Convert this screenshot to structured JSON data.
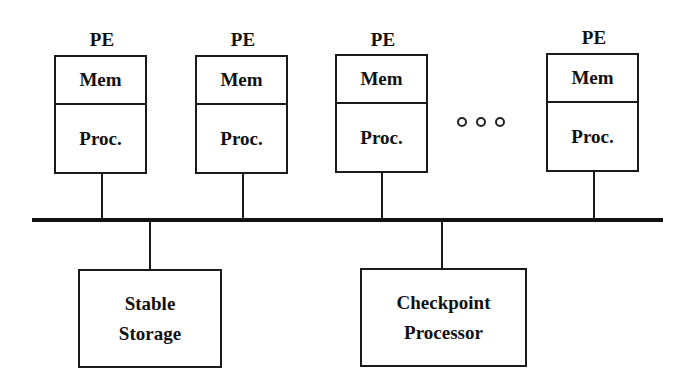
{
  "diagram": {
    "type": "system-architecture",
    "pe_elements": [
      {
        "label": "PE",
        "mem": "Mem",
        "proc": "Proc."
      },
      {
        "label": "PE",
        "mem": "Mem",
        "proc": "Proc."
      },
      {
        "label": "PE",
        "mem": "Mem",
        "proc": "Proc."
      },
      {
        "label": "PE",
        "mem": "Mem",
        "proc": "Proc."
      }
    ],
    "ellipsis": "○○○",
    "bus": "shared bus",
    "devices": [
      {
        "line1": "Stable",
        "line2": "Storage"
      },
      {
        "line1": "Checkpoint",
        "line2": "Processor"
      }
    ],
    "colors": {
      "stroke": "#1a1a1a",
      "background": "#ffffff"
    }
  }
}
